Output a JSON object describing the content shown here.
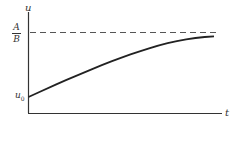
{
  "chart_data": {
    "type": "line",
    "title": "",
    "xlabel": "t",
    "ylabel": "u",
    "y_annotations": [
      {
        "label": "A/B",
        "numerator": "A",
        "denominator": "B",
        "style": "dashed asymptote",
        "value": "A/B"
      },
      {
        "label": "u0",
        "base": "u",
        "subscript": "0",
        "style": "initial value",
        "value": "u0"
      }
    ],
    "series": [
      {
        "name": "u(t)",
        "description": "Concave-down curve starting at u0 at t=0 and rising asymptotically toward A/B",
        "x": [
          0,
          0.1,
          0.2,
          0.3,
          0.4,
          0.5,
          0.6,
          0.7,
          0.8,
          0.9,
          1.0
        ],
        "y_normalized": [
          0.0,
          0.13,
          0.26,
          0.38,
          0.5,
          0.61,
          0.71,
          0.8,
          0.87,
          0.92,
          0.94
        ]
      }
    ],
    "grid": false,
    "legend": "none",
    "colors": {
      "axis": "#333333",
      "curve": "#222222",
      "asymptote": "#555555"
    }
  },
  "labels": {
    "y_axis": "u",
    "x_axis": "t",
    "asymptote_num": "A",
    "asymptote_den": "B",
    "initial_base": "u",
    "initial_sub": "0"
  }
}
